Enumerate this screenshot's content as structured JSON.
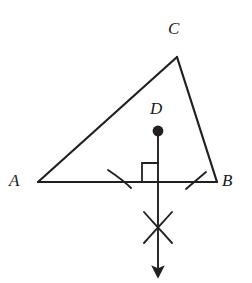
{
  "figure": {
    "background_color": "#ffffff",
    "stroke_color": "#231f20",
    "labels": {
      "A": "A",
      "B": "B",
      "C": "C",
      "D": "D"
    },
    "points": {
      "A": {
        "x": 38,
        "y": 182
      },
      "B": {
        "x": 217,
        "y": 182
      },
      "C": {
        "x": 177,
        "y": 57
      },
      "D": {
        "x": 158,
        "y": 131
      },
      "foot": {
        "x": 158,
        "y": 182
      },
      "arc_cross": {
        "x": 158,
        "y": 228
      },
      "arrow_tip": {
        "x": 158,
        "y": 278
      }
    },
    "segments": [
      {
        "name": "side-AB",
        "from": "A",
        "to": "B"
      },
      {
        "name": "side-AC",
        "from": "A",
        "to": "C"
      },
      {
        "name": "side-BC",
        "from": "B",
        "to": "C"
      }
    ],
    "construction": {
      "perpendicular_line": "vertical ray through D and midpoint of AB, arrow pointing down",
      "right_angle_marker": "square at intersection of ray and AB, above-left of foot",
      "arc_tick_left": "construction arc crossing AB left of foot",
      "arc_tick_right": "construction arc crossing AB right of foot",
      "arc_intersection_mark": "X formed by two intersecting arcs below AB"
    },
    "stroke_widths": {
      "triangle": 2.2,
      "ray": 1.9,
      "arc_marks": 1.9,
      "right_angle": 1.8
    }
  }
}
